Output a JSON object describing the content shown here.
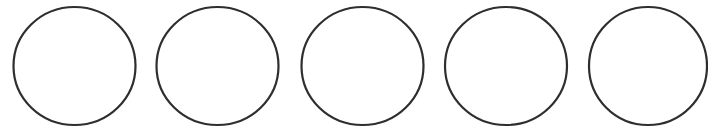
{
  "figure": {
    "background_color": "#ffffff",
    "stroke_color": "#2e2e2e",
    "circles": [
      {
        "id": 1,
        "label": ""
      },
      {
        "id": 2,
        "label": ""
      },
      {
        "id": 3,
        "label": ""
      },
      {
        "id": 4,
        "label": ""
      },
      {
        "id": 5,
        "label": ""
      }
    ]
  }
}
